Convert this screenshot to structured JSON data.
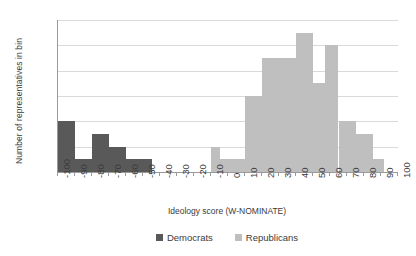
{
  "chart_data": {
    "type": "bar",
    "title": "",
    "xlabel": "Ideology score (W-NOMINATE)",
    "ylabel": "Number of representatives in bin",
    "xlim": [
      -100,
      100
    ],
    "ylim": [
      0,
      12
    ],
    "bin_width": 10,
    "grid": "horizontal",
    "legend_position": "bottom-center",
    "xticks": [
      "-100",
      "-90",
      "-80",
      "-70",
      "-60",
      "-50",
      "-40",
      "-30",
      "-20",
      "-10",
      "0",
      "10",
      "20",
      "30",
      "40",
      "50",
      "60",
      "70",
      "80",
      "90",
      "100"
    ],
    "yticks": [
      "0",
      "2",
      "4",
      "6",
      "8",
      "10",
      "12"
    ],
    "series": [
      {
        "name": "Democrats",
        "color": "#595959",
        "bins": [
          {
            "x0": -100,
            "x1": -90,
            "value": 4
          },
          {
            "x0": -90,
            "x1": -80,
            "value": 1
          },
          {
            "x0": -80,
            "x1": -70,
            "value": 3
          },
          {
            "x0": -70,
            "x1": -60,
            "value": 2
          },
          {
            "x0": -60,
            "x1": -50,
            "value": 1
          },
          {
            "x0": -50,
            "x1": -45,
            "value": 1
          }
        ]
      },
      {
        "name": "Republicans",
        "color": "#bfbfbf",
        "bins": [
          {
            "x0": -10,
            "x1": -5,
            "value": 2
          },
          {
            "x0": -5,
            "x1": 10,
            "value": 1
          },
          {
            "x0": 10,
            "x1": 20,
            "value": 6
          },
          {
            "x0": 20,
            "x1": 30,
            "value": 9
          },
          {
            "x0": 30,
            "x1": 40,
            "value": 9
          },
          {
            "x0": 40,
            "x1": 50,
            "value": 11
          },
          {
            "x0": 50,
            "x1": 57,
            "value": 7
          },
          {
            "x0": 57,
            "x1": 65,
            "value": 10
          },
          {
            "x0": 65,
            "x1": 75,
            "value": 4
          },
          {
            "x0": 75,
            "x1": 85,
            "value": 3
          },
          {
            "x0": 85,
            "x1": 92,
            "value": 1
          }
        ]
      }
    ],
    "legend": [
      {
        "label": "Democrats",
        "color": "#595959"
      },
      {
        "label": "Republicans",
        "color": "#bfbfbf"
      }
    ]
  }
}
